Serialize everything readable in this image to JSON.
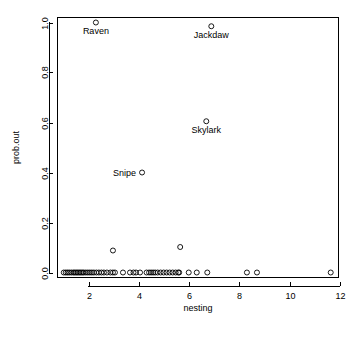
{
  "chart_data": {
    "type": "scatter",
    "title": "",
    "subtitle": "",
    "xlabel": "nesting",
    "ylabel": "prob.out",
    "xlim": [
      0.75,
      11.95
    ],
    "ylim": [
      -0.02,
      1.02
    ],
    "grid": false,
    "legend": null,
    "legend_position": "none",
    "xticks": [
      "2",
      "4",
      "6",
      "8",
      "10",
      "12"
    ],
    "xtick_values": [
      2,
      4,
      6,
      8,
      10,
      12
    ],
    "yticks": [
      "0.0",
      "0.2",
      "0.4",
      "0.6",
      "0.8",
      "1.0"
    ],
    "ytick_values": [
      0.0,
      0.2,
      0.4,
      0.6,
      0.8,
      1.0
    ],
    "marker": "open-circle",
    "marker_color": "#000000",
    "points": [
      {
        "x": 2.28,
        "y": 1.0
      },
      {
        "x": 6.88,
        "y": 0.985
      },
      {
        "x": 6.68,
        "y": 0.605
      },
      {
        "x": 4.12,
        "y": 0.4
      },
      {
        "x": 5.64,
        "y": 0.102
      },
      {
        "x": 2.96,
        "y": 0.088
      },
      {
        "x": 1.0,
        "y": 0.0
      },
      {
        "x": 1.08,
        "y": 0.0
      },
      {
        "x": 1.15,
        "y": 0.0
      },
      {
        "x": 1.22,
        "y": 0.0
      },
      {
        "x": 1.3,
        "y": 0.0
      },
      {
        "x": 1.38,
        "y": 0.0
      },
      {
        "x": 1.44,
        "y": 0.0
      },
      {
        "x": 1.5,
        "y": 0.0
      },
      {
        "x": 1.56,
        "y": 0.0
      },
      {
        "x": 1.62,
        "y": 0.0
      },
      {
        "x": 1.68,
        "y": 0.0
      },
      {
        "x": 1.74,
        "y": 0.0
      },
      {
        "x": 1.8,
        "y": 0.0
      },
      {
        "x": 1.88,
        "y": 0.0
      },
      {
        "x": 1.96,
        "y": 0.0
      },
      {
        "x": 2.04,
        "y": 0.0
      },
      {
        "x": 2.12,
        "y": 0.0
      },
      {
        "x": 2.2,
        "y": 0.0
      },
      {
        "x": 2.3,
        "y": 0.0
      },
      {
        "x": 2.4,
        "y": 0.0
      },
      {
        "x": 2.5,
        "y": 0.0
      },
      {
        "x": 2.6,
        "y": 0.0
      },
      {
        "x": 2.72,
        "y": 0.0
      },
      {
        "x": 2.86,
        "y": 0.0
      },
      {
        "x": 2.96,
        "y": 0.0
      },
      {
        "x": 3.04,
        "y": 0.0
      },
      {
        "x": 3.36,
        "y": 0.0
      },
      {
        "x": 3.64,
        "y": 0.0
      },
      {
        "x": 3.78,
        "y": 0.0
      },
      {
        "x": 3.88,
        "y": 0.0
      },
      {
        "x": 4.04,
        "y": 0.0
      },
      {
        "x": 4.3,
        "y": 0.0
      },
      {
        "x": 4.4,
        "y": 0.0
      },
      {
        "x": 4.48,
        "y": 0.0
      },
      {
        "x": 4.56,
        "y": 0.0
      },
      {
        "x": 4.64,
        "y": 0.0
      },
      {
        "x": 4.74,
        "y": 0.0
      },
      {
        "x": 4.86,
        "y": 0.0
      },
      {
        "x": 4.98,
        "y": 0.0
      },
      {
        "x": 5.1,
        "y": 0.0
      },
      {
        "x": 5.22,
        "y": 0.0
      },
      {
        "x": 5.34,
        "y": 0.0
      },
      {
        "x": 5.46,
        "y": 0.0
      },
      {
        "x": 5.56,
        "y": 0.0
      },
      {
        "x": 5.6,
        "y": 0.0
      },
      {
        "x": 5.98,
        "y": 0.0
      },
      {
        "x": 6.3,
        "y": 0.0
      },
      {
        "x": 6.72,
        "y": 0.0
      },
      {
        "x": 8.3,
        "y": 0.0
      },
      {
        "x": 8.7,
        "y": 0.0
      },
      {
        "x": 11.64,
        "y": 0.0
      }
    ],
    "annotations": [
      {
        "text": "Raven",
        "x": 2.28,
        "y": 1.0,
        "position": "below"
      },
      {
        "text": "Jackdaw",
        "x": 6.88,
        "y": 0.985,
        "position": "below"
      },
      {
        "text": "Skylark",
        "x": 6.68,
        "y": 0.605,
        "position": "below"
      },
      {
        "text": "Snipe",
        "x": 4.12,
        "y": 0.4,
        "position": "left"
      }
    ]
  }
}
